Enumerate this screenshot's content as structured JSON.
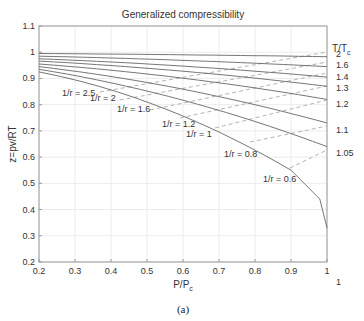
{
  "chart_data": {
    "type": "line",
    "title": "Generalized compressibility",
    "xlabel": "P/P_c",
    "ylabel": "z=pv/RT",
    "caption": "(a)",
    "xlim": [
      0.2,
      1
    ],
    "ylim": [
      0.2,
      1.1
    ],
    "xticks": [
      "0.2",
      "0.3",
      "0.4",
      "0.5",
      "0.6",
      "0.7",
      "0.8",
      "0.9",
      "1"
    ],
    "yticks": [
      "0.2",
      "0.3",
      "0.4",
      "0.5",
      "0.6",
      "0.7",
      "0.8",
      "0.9",
      "1",
      "1.1"
    ],
    "grid": true,
    "right_axis_title": "T/T_c",
    "isotherms": [
      {
        "name": "T/Tc = 2",
        "label": "2",
        "x": [
          0.2,
          1
        ],
        "y": [
          0.995,
          0.983
        ]
      },
      {
        "name": "T/Tc = 1.6",
        "label": "1.6",
        "x": [
          0.2,
          1
        ],
        "y": [
          0.985,
          0.945
        ]
      },
      {
        "name": "T/Tc = 1.4",
        "label": "1.4",
        "x": [
          0.2,
          1
        ],
        "y": [
          0.975,
          0.905
        ]
      },
      {
        "name": "T/Tc = 1.3",
        "label": "1.3",
        "x": [
          0.2,
          1
        ],
        "y": [
          0.966,
          0.87
        ]
      },
      {
        "name": "T/Tc = 1.2",
        "label": "1.2",
        "x": [
          0.2,
          1
        ],
        "y": [
          0.955,
          0.82
        ]
      },
      {
        "name": "T/Tc = 1.1",
        "label": "1.1",
        "x": [
          0.2,
          1
        ],
        "y": [
          0.945,
          0.73
        ]
      },
      {
        "name": "T/Tc = 1.05",
        "label": "1.05",
        "x": [
          0.2,
          1
        ],
        "y": [
          0.935,
          0.64
        ]
      },
      {
        "name": "T/Tc = 1",
        "label": "1",
        "x": [
          0.2,
          0.9,
          0.98,
          1
        ],
        "y": [
          0.925,
          0.55,
          0.44,
          0.33
        ]
      }
    ],
    "density_lines": [
      {
        "name": "1/r = 2.5",
        "label": "1/r = 2.5"
      },
      {
        "name": "1/r = 2",
        "label": "1/r = 2"
      },
      {
        "name": "1/r = 1.6",
        "label": "1/r = 1.6"
      },
      {
        "name": "1/r = 1.2",
        "label": "1/r = 1.2"
      },
      {
        "name": "1/r = 1",
        "label": "1/r = 1"
      },
      {
        "name": "1/r = 0.8",
        "label": "1/r = 0.8"
      },
      {
        "name": "1/r = 0.6",
        "label": "1/r = 0.6"
      }
    ]
  }
}
